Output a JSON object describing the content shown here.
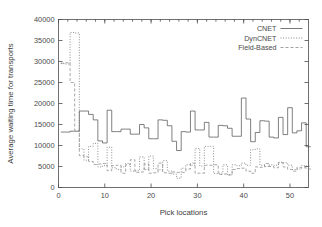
{
  "chart_data": {
    "type": "line",
    "title": "",
    "xlabel": "Pick locations",
    "ylabel": "Average waiting time for transports",
    "xlim": [
      0,
      54
    ],
    "ylim": [
      0,
      40000
    ],
    "xticks": [
      0,
      10,
      20,
      30,
      40,
      50
    ],
    "yticks": [
      0,
      5000,
      10000,
      15000,
      20000,
      25000,
      30000,
      35000,
      40000
    ],
    "grid": false,
    "legend_position": "top-right",
    "x": [
      1,
      2,
      3,
      4,
      5,
      6,
      7,
      8,
      9,
      10,
      11,
      12,
      13,
      14,
      15,
      16,
      17,
      18,
      19,
      20,
      21,
      22,
      23,
      24,
      25,
      26,
      27,
      28,
      29,
      30,
      31,
      32,
      33,
      34,
      35,
      36,
      37,
      38,
      39,
      40,
      41,
      42,
      43,
      44,
      45,
      46,
      47,
      48,
      49,
      50,
      51,
      52,
      53,
      54
    ],
    "series": [
      {
        "name": "CNET",
        "style": "solid",
        "color": "#555555",
        "values": [
          13200,
          13200,
          13400,
          13400,
          18200,
          18200,
          17400,
          16100,
          11100,
          10600,
          18400,
          13300,
          13300,
          13900,
          13900,
          12700,
          12700,
          15000,
          14200,
          11600,
          11600,
          16100,
          16000,
          14700,
          11000,
          8800,
          13300,
          13200,
          18200,
          13700,
          13700,
          15500,
          12000,
          12000,
          14800,
          14700,
          14100,
          12200,
          12200,
          21300,
          16300,
          10900,
          13100,
          15900,
          15800,
          12000,
          11800,
          16700,
          12600,
          19000,
          13000,
          13500,
          15400,
          9700
        ]
      },
      {
        "name": "DynCNET",
        "style": "dotted",
        "color": "#6b6b6b",
        "values": [
          29500,
          29400,
          36900,
          36800,
          9200,
          6500,
          9800,
          10500,
          4900,
          5200,
          9600,
          4700,
          4300,
          4900,
          5700,
          3900,
          4000,
          7300,
          4300,
          7500,
          4500,
          4200,
          6400,
          3900,
          3200,
          2200,
          4600,
          5400,
          5300,
          9300,
          5100,
          9800,
          9800,
          3300,
          3400,
          5400,
          3000,
          5400,
          5200,
          5800,
          5300,
          9000,
          9200,
          5300,
          5000,
          5400,
          5300,
          6000,
          5900,
          5300,
          4300,
          4400,
          5200,
          5100
        ]
      },
      {
        "name": "Field-Based",
        "style": "dashed",
        "color": "#8a8a8a",
        "values": [
          29600,
          29700,
          25000,
          13600,
          7600,
          7300,
          6200,
          5500,
          5600,
          5700,
          4000,
          5200,
          5300,
          3400,
          5400,
          6600,
          3600,
          3700,
          5600,
          3400,
          3500,
          5800,
          3500,
          3400,
          3700,
          3600,
          3600,
          4400,
          5800,
          3400,
          3400,
          5300,
          5300,
          5400,
          3100,
          3200,
          3000,
          4300,
          4500,
          4600,
          3900,
          3400,
          4900,
          4800,
          5700,
          5000,
          4700,
          5900,
          4900,
          4300,
          3900,
          4800,
          4700,
          4400
        ]
      }
    ]
  },
  "legend": {
    "items": [
      {
        "label": "CNET"
      },
      {
        "label": "DynCNET"
      },
      {
        "label": "Field-Based"
      }
    ]
  },
  "axes": {
    "x_title": "Pick locations",
    "y_title": "Average waiting time for transports",
    "x_tick_labels": [
      "0",
      "10",
      "20",
      "30",
      "40",
      "50"
    ],
    "y_tick_labels": [
      "0",
      "5000",
      "10000",
      "15000",
      "20000",
      "25000",
      "30000",
      "35000",
      "40000"
    ]
  }
}
